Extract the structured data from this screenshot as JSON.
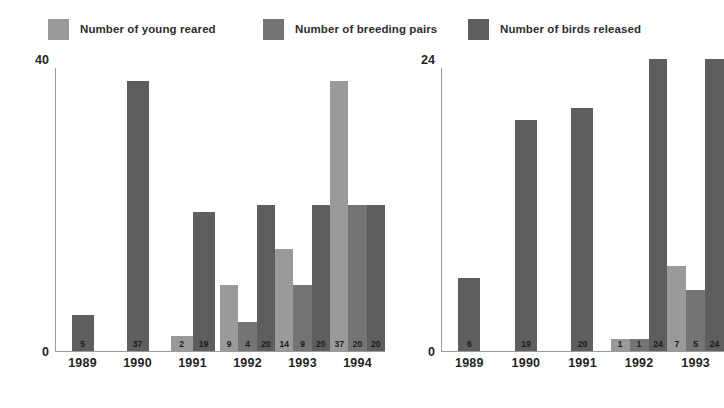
{
  "legend": {
    "items": [
      {
        "label": "Number of young reared",
        "color": "#9a9a9a",
        "key": "young_reared"
      },
      {
        "label": "Number of breeding pairs",
        "color": "#747474",
        "key": "breeding_pairs"
      },
      {
        "label": "Number of birds released",
        "color": "#5e5e5e",
        "key": "birds_released"
      }
    ]
  },
  "caption": {
    "left": "",
    "right": ""
  },
  "chart_data": [
    {
      "id": "left",
      "type": "bar",
      "title": "",
      "xlabel": "",
      "ylabel": "",
      "ylim": [
        0,
        40
      ],
      "yticks": [
        0,
        40
      ],
      "ytick_labels": [
        "0",
        "40"
      ],
      "grid": false,
      "legend_position": "top",
      "categories": [
        "1989",
        "1990",
        "1991",
        "1992",
        "1993",
        "1994"
      ],
      "series": [
        {
          "name": "Number of young reared",
          "color": "#9a9a9a",
          "values": [
            null,
            null,
            2,
            9,
            14,
            37
          ]
        },
        {
          "name": "Number of breeding pairs",
          "color": "#747474",
          "values": [
            null,
            null,
            null,
            4,
            9,
            20
          ]
        },
        {
          "name": "Number of birds released",
          "color": "#5e5e5e",
          "values": [
            5,
            37,
            19,
            20,
            20,
            20
          ]
        }
      ]
    },
    {
      "id": "right",
      "type": "bar",
      "title": "",
      "xlabel": "",
      "ylabel": "",
      "ylim": [
        0,
        24
      ],
      "yticks": [
        0,
        24
      ],
      "ytick_labels": [
        "0",
        "24"
      ],
      "grid": false,
      "legend_position": "top",
      "categories": [
        "1989",
        "1990",
        "1991",
        "1992",
        "1993"
      ],
      "series": [
        {
          "name": "Number of young reared",
          "color": "#9a9a9a",
          "values": [
            null,
            null,
            null,
            1,
            7
          ]
        },
        {
          "name": "Number of breeding pairs",
          "color": "#747474",
          "values": [
            null,
            null,
            null,
            1,
            5
          ]
        },
        {
          "name": "Number of birds released",
          "color": "#5e5e5e",
          "values": [
            6,
            19,
            20,
            24,
            24
          ]
        }
      ]
    }
  ]
}
